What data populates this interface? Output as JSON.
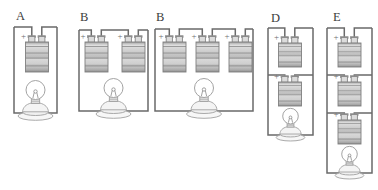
{
  "figure": {
    "polarity_mark": "+",
    "colors": {
      "background": "#ffffff",
      "wire": "#6a6a6a",
      "outline": "#8f8f8f",
      "bulb_outline": "#a0a0a0",
      "label_text": "#3c3c3c",
      "battery_band_light": "#dedede",
      "battery_band_dark": "#9e9e9e"
    }
  },
  "circuits": [
    {
      "label": "A",
      "battery_count": 1,
      "battery_arrangement": "series",
      "bulb_count": 1
    },
    {
      "label": "B",
      "battery_count": 2,
      "battery_arrangement": "series",
      "bulb_count": 1
    },
    {
      "label": "B",
      "battery_count": 3,
      "battery_arrangement": "series",
      "bulb_count": 1
    },
    {
      "label": "D",
      "battery_count": 2,
      "battery_arrangement": "parallel",
      "bulb_count": 1
    },
    {
      "label": "E",
      "battery_count": 3,
      "battery_arrangement": "parallel",
      "bulb_count": 1
    }
  ]
}
